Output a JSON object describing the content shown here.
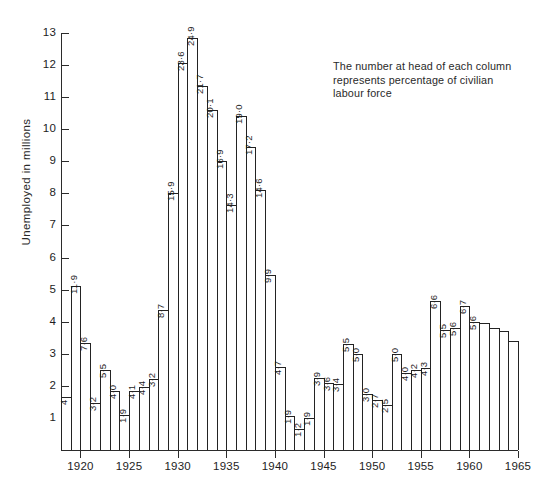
{
  "chart_data": {
    "type": "bar",
    "title": "",
    "xlabel": "",
    "ylabel": "Unemployed in millions",
    "ylim": [
      0,
      13
    ],
    "xlim": [
      1919,
      1965
    ],
    "grid": false,
    "legend": null,
    "annotation": [
      "The number at head of each column",
      "represents percentage of civilian",
      "labour force"
    ],
    "y_ticks": [
      0,
      1,
      2,
      3,
      4,
      5,
      6,
      7,
      8,
      9,
      10,
      11,
      12,
      13
    ],
    "x_ticks": [
      1920,
      1925,
      1930,
      1935,
      1940,
      1945,
      1950,
      1955,
      1960,
      1965
    ],
    "categories": [
      1919,
      1920,
      1921,
      1922,
      1923,
      1924,
      1925,
      1926,
      1927,
      1928,
      1929,
      1930,
      1931,
      1932,
      1933,
      1934,
      1935,
      1936,
      1937,
      1938,
      1939,
      1940,
      1941,
      1942,
      1943,
      1944,
      1945,
      1946,
      1947,
      1948,
      1949,
      1950,
      1951,
      1952,
      1953,
      1954,
      1955,
      1956,
      1957,
      1958,
      1959,
      1960,
      1961,
      1962,
      1963,
      1964,
      1965
    ],
    "values": [
      1.65,
      5.1,
      3.35,
      1.45,
      2.5,
      1.85,
      1.1,
      1.85,
      1.95,
      2.2,
      4.35,
      8.0,
      12.05,
      12.85,
      11.35,
      10.6,
      9.0,
      7.65,
      10.4,
      9.45,
      8.1,
      5.45,
      2.6,
      1.05,
      0.65,
      1.0,
      2.25,
      2.1,
      2.05,
      3.3,
      3.0,
      1.75,
      1.55,
      1.4,
      3.0,
      2.4,
      2.5,
      2.55,
      4.65,
      3.75,
      3.8,
      4.5,
      4.0,
      3.95,
      3.8,
      3.7,
      3.4
    ],
    "bar_labels": [
      "4",
      "11·9",
      "7·6",
      "3·2",
      "5·5",
      "4·0",
      "1·9",
      "4·1",
      "4·4",
      "3·2",
      "8·7",
      "15·9",
      "23·6",
      "24·9",
      "21·7",
      "20·1",
      "16·9",
      "14·3",
      "19·0",
      "17·2",
      "14·6",
      "9·9",
      "4·7",
      "1·9",
      "1·2",
      "1·9",
      "3·9",
      "3·6",
      "3·4",
      "5·5",
      "5·0",
      "3·0",
      "2·7",
      "2·5",
      "5·0",
      "4·0",
      "4·2",
      "4·3",
      "6·6",
      "5·5",
      "5·6",
      "6·7",
      "5·6",
      "",
      "",
      "",
      ""
    ]
  },
  "bottom_caption": ""
}
